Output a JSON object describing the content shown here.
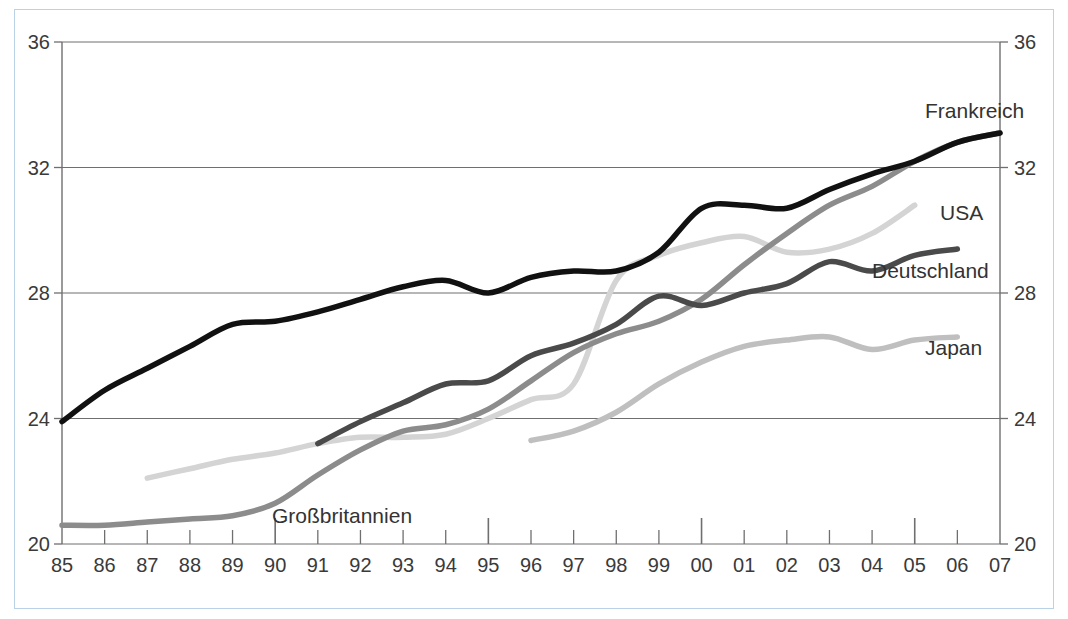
{
  "chart_data": {
    "type": "line",
    "title": "",
    "subtitle": "",
    "xlabel": "",
    "ylabel": "",
    "xlim": [
      1985,
      2007
    ],
    "ylim": [
      20,
      36
    ],
    "ytick_values": [
      20,
      24,
      28,
      32,
      36
    ],
    "ytick_labels_left": [
      "20",
      "24",
      "28",
      "32",
      "36"
    ],
    "ytick_labels_right": [
      "20",
      "24",
      "28",
      "32",
      "36"
    ],
    "grid": true,
    "grid_axis": "y",
    "legend_position": "inline-right-end-labels",
    "x": [
      1985,
      1986,
      1987,
      1988,
      1989,
      1990,
      1991,
      1992,
      1993,
      1994,
      1995,
      1996,
      1997,
      1998,
      1999,
      2000,
      2001,
      2002,
      2003,
      2004,
      2005,
      2006,
      2007
    ],
    "xtick_labels": [
      "85",
      "86",
      "87",
      "88",
      "89",
      "90",
      "91",
      "92",
      "93",
      "94",
      "95",
      "96",
      "97",
      "98",
      "99",
      "00",
      "01",
      "02",
      "03",
      "04",
      "05",
      "06",
      "07"
    ],
    "xtick_major": [
      "90",
      "95",
      "00",
      "05"
    ],
    "series": [
      {
        "name": "Frankreich",
        "color": "#111111",
        "width": 5.5,
        "label": "Frankreich",
        "x": [
          1985,
          1986,
          1987,
          1988,
          1989,
          1990,
          1991,
          1992,
          1993,
          1994,
          1995,
          1996,
          1997,
          1998,
          1999,
          2000,
          2001,
          2002,
          2003,
          2004,
          2005,
          2006,
          2007
        ],
        "values": [
          23.9,
          24.9,
          25.6,
          26.3,
          27.0,
          27.1,
          27.4,
          27.8,
          28.2,
          28.4,
          28.0,
          28.5,
          28.7,
          28.7,
          29.3,
          30.7,
          30.8,
          30.7,
          31.3,
          31.8,
          32.2,
          32.8,
          33.1
        ]
      },
      {
        "name": "Großbritannien",
        "color": "#8c8c8c",
        "width": 5.5,
        "label": "Großbritannien",
        "x": [
          1985,
          1986,
          1987,
          1988,
          1989,
          1990,
          1991,
          1992,
          1993,
          1994,
          1995,
          1996,
          1997,
          1998,
          1999,
          2000,
          2001,
          2002,
          2003,
          2004,
          2005,
          2006,
          2007
        ],
        "values": [
          20.6,
          20.6,
          20.7,
          20.8,
          20.9,
          21.3,
          22.2,
          23.0,
          23.6,
          23.8,
          24.3,
          25.2,
          26.1,
          26.7,
          27.1,
          27.8,
          28.9,
          29.9,
          30.8,
          31.4,
          32.2,
          32.8,
          33.1
        ]
      },
      {
        "name": "USA",
        "color": "#d4d4d4",
        "width": 5.5,
        "label": "USA",
        "x": [
          1987,
          1988,
          1989,
          1990,
          1991,
          1992,
          1993,
          1994,
          1995,
          1996,
          1997,
          1998,
          1999,
          2000,
          2001,
          2002,
          2003,
          2004,
          2005
        ],
        "values": [
          22.1,
          22.4,
          22.7,
          22.9,
          23.2,
          23.4,
          23.4,
          23.5,
          24.0,
          24.6,
          25.1,
          28.4,
          29.2,
          29.6,
          29.8,
          29.3,
          29.4,
          29.9,
          30.8
        ]
      },
      {
        "name": "Deutschland",
        "color": "#4a4a4a",
        "width": 5.5,
        "label": "Deutschland",
        "x": [
          1991,
          1992,
          1993,
          1994,
          1995,
          1996,
          1997,
          1998,
          1999,
          2000,
          2001,
          2002,
          2003,
          2004,
          2005,
          2006
        ],
        "values": [
          23.2,
          23.9,
          24.5,
          25.1,
          25.2,
          26.0,
          26.4,
          27.0,
          27.9,
          27.6,
          28.0,
          28.3,
          29.0,
          28.7,
          29.2,
          29.4
        ]
      },
      {
        "name": "Japan",
        "color": "#bfbfbf",
        "width": 5.5,
        "label": "Japan",
        "x": [
          1996,
          1997,
          1998,
          1999,
          2000,
          2001,
          2002,
          2003,
          2004,
          2005,
          2006
        ],
        "values": [
          23.3,
          23.6,
          24.2,
          25.1,
          25.8,
          26.3,
          26.5,
          26.6,
          26.2,
          26.5,
          26.6
        ]
      }
    ],
    "series_end_labels": [
      {
        "name": "Frankreich",
        "label": "Frankreich",
        "x": 925,
        "y": 118
      },
      {
        "name": "USA",
        "label": "USA",
        "x": 940,
        "y": 220
      },
      {
        "name": "Deutschland",
        "label": "Deutschland",
        "x": 872,
        "y": 278
      },
      {
        "name": "Japan",
        "label": "Japan",
        "x": 925,
        "y": 355
      },
      {
        "name": "Großbritannien",
        "label": "Großbritannien",
        "x": 272,
        "y": 523
      }
    ]
  },
  "colors": {
    "frame_border": "#b9d2e8",
    "axis": "#6f6f6f",
    "grid": "#6f6f6f",
    "tick_text": "#3a3a3a",
    "label_text": "#333333",
    "background": "#ffffff"
  }
}
